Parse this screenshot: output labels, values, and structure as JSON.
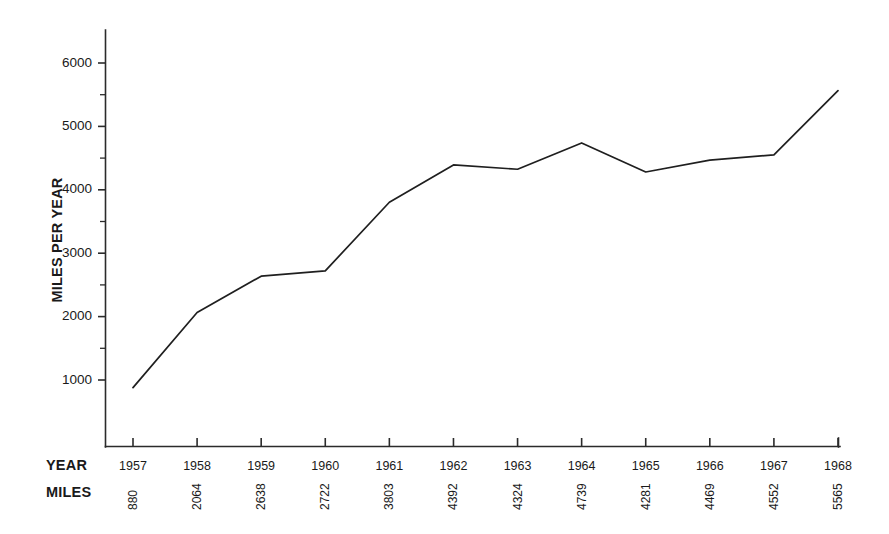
{
  "chart_data": {
    "type": "line",
    "title": "",
    "xlabel": "YEAR",
    "ylabel": "MILES PER YEAR",
    "categories": [
      "1957",
      "1958",
      "1959",
      "1960",
      "1961",
      "1962",
      "1963",
      "1964",
      "1965",
      "1966",
      "1967",
      "1968"
    ],
    "values": [
      880,
      2064,
      2638,
      2722,
      3803,
      4392,
      4324,
      4739,
      4281,
      4469,
      4552,
      5565
    ],
    "value_labels": [
      "880",
      "2064",
      "2638",
      "2722",
      "3803",
      "4392",
      "4324",
      "4739",
      "4281",
      "4469",
      "4552",
      "5565"
    ],
    "ylim": [
      0,
      6400
    ],
    "ytick_values": [
      1000,
      2000,
      3000,
      4000,
      5000,
      6000
    ],
    "ytick_labels": [
      "1000",
      "2000",
      "3000",
      "4000",
      "5000",
      "6000"
    ],
    "yminor_values": [
      1500,
      2500,
      3500,
      4500,
      5500
    ],
    "grid": false,
    "legend": false,
    "legend_position": "none",
    "line_color": "#1f1f1f",
    "axis_color": "#2b2b2b",
    "background_color": "#ffffff"
  },
  "labels": {
    "year_row": "YEAR",
    "miles_row": "MILES",
    "y_axis_title": "MILES PER YEAR"
  }
}
